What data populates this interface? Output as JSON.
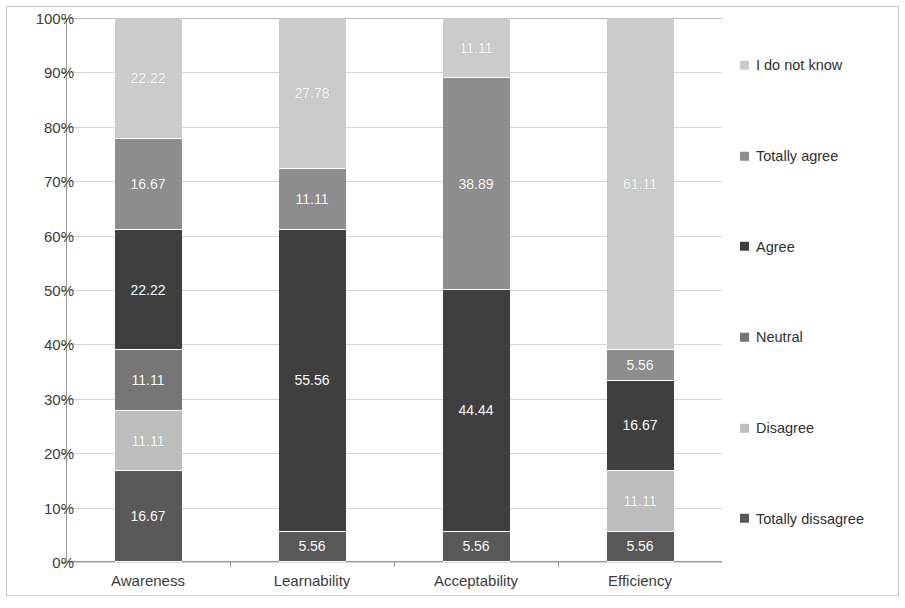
{
  "chart_data": {
    "type": "bar",
    "subtype": "stacked-100-percent",
    "title": "",
    "xlabel": "",
    "ylabel": "",
    "ylim": [
      0,
      100
    ],
    "ytick_labels": [
      "0%",
      "10%",
      "20%",
      "30%",
      "40%",
      "50%",
      "60%",
      "70%",
      "80%",
      "90%",
      "100%"
    ],
    "ytick_values": [
      0,
      10,
      20,
      30,
      40,
      50,
      60,
      70,
      80,
      90,
      100
    ],
    "grid": true,
    "legend_position": "right",
    "categories": [
      "Awareness",
      "Learnability",
      "Acceptability",
      "Efficiency"
    ],
    "series": [
      {
        "name": "Totally dissagree",
        "color": "#595959",
        "values": [
          16.67,
          5.56,
          5.56,
          5.56
        ],
        "labels": [
          "16.67",
          "5.56",
          "5.56",
          "5.56"
        ]
      },
      {
        "name": "Disagree",
        "color": "#bdbdbd",
        "values": [
          11.11,
          0,
          0,
          11.11
        ],
        "labels": [
          "11.11",
          "",
          "",
          "11.11"
        ]
      },
      {
        "name": "Neutral",
        "color": "#767676",
        "values": [
          11.11,
          0,
          0,
          0
        ],
        "labels": [
          "11.11",
          "",
          "",
          ""
        ]
      },
      {
        "name": "Agree",
        "color": "#3f3f3f",
        "values": [
          22.22,
          55.56,
          44.44,
          16.67
        ],
        "labels": [
          "22.22",
          "55.56",
          "44.44",
          "16.67"
        ]
      },
      {
        "name": "Totally agree",
        "color": "#8d8d8d",
        "values": [
          16.67,
          11.11,
          38.89,
          5.56
        ],
        "labels": [
          "16.67",
          "11.11",
          "38.89",
          "5.56"
        ]
      },
      {
        "name": "I do not know",
        "color": "#cbcbcb",
        "values": [
          22.22,
          27.78,
          11.11,
          61.11
        ],
        "labels": [
          "22.22",
          "27.78",
          "11.11",
          "61.11"
        ]
      }
    ],
    "legend_order": [
      "I do not know",
      "Totally agree",
      "Agree",
      "Neutral",
      "Disagree",
      "Totally dissagree"
    ]
  }
}
